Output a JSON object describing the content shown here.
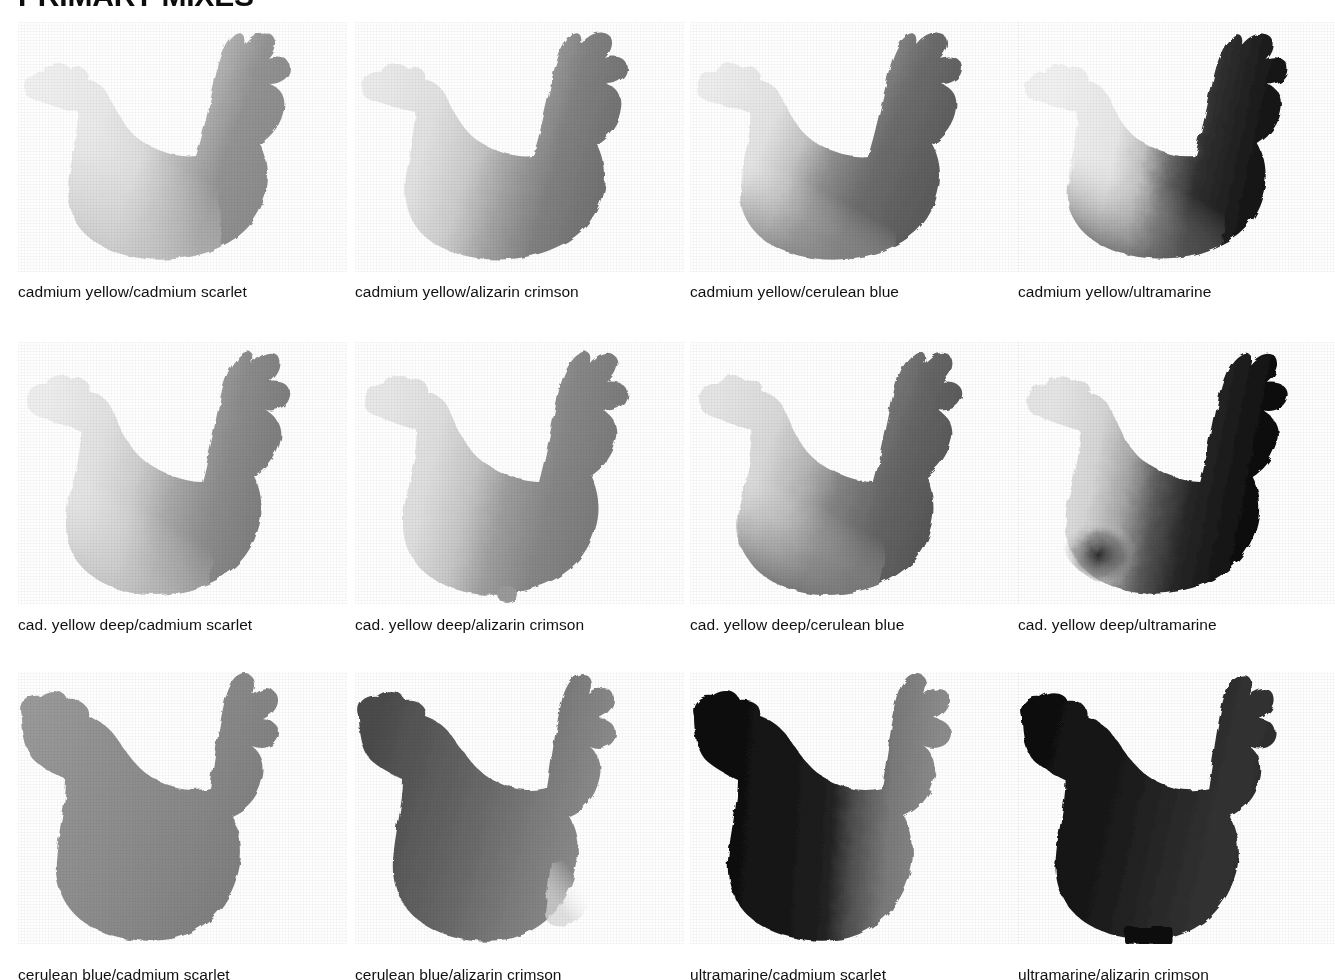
{
  "page": {
    "title": "PRIMARY MIXES",
    "background_color": "#ffffff",
    "text_color": "#111111",
    "columns": 4,
    "rows": 3
  },
  "swatches": [
    {
      "id": "cadmium-yellow-cadmium-scarlet",
      "caption": "cadmium yellow/cadmium scarlet",
      "shape": "hen-silhouette",
      "tone": {
        "light": "#ececec",
        "mid": "#cfcfcf",
        "dark": "#8d8d8d",
        "deepest": "#7e7e7e"
      },
      "gradient_direction": "left-light-to-right-dark",
      "overall_value": "very light"
    },
    {
      "id": "cadmium-yellow-alizarin-crimson",
      "caption": "cadmium yellow/alizarin crimson",
      "shape": "hen-silhouette",
      "tone": {
        "light": "#e6e6e6",
        "mid": "#c2c2c2",
        "dark": "#7b7b7b",
        "deepest": "#6a6a6a"
      },
      "gradient_direction": "left-light-to-right-dark",
      "overall_value": "light"
    },
    {
      "id": "cadmium-yellow-cerulean-blue",
      "caption": "cadmium yellow/cerulean blue",
      "shape": "hen-silhouette",
      "tone": {
        "light": "#e8e8e8",
        "mid": "#bdbdbd",
        "dark": "#6f6f6f",
        "deepest": "#5c5c5c"
      },
      "gradient_direction": "left-light-to-right-dark",
      "overall_value": "light-medium"
    },
    {
      "id": "cadmium-yellow-ultramarine",
      "caption": "cadmium yellow/ultramarine",
      "shape": "hen-silhouette",
      "tone": {
        "light": "#eaeaea",
        "mid": "#b0b0b0",
        "dark": "#3a3a3a",
        "deepest": "#141414"
      },
      "gradient_direction": "left-light-to-right-very-dark",
      "overall_value": "high contrast"
    },
    {
      "id": "cad-yellow-deep-cadmium-scarlet",
      "caption": "cad. yellow deep/cadmium scarlet",
      "shape": "hen-silhouette",
      "tone": {
        "light": "#e4e4e4",
        "mid": "#c7c7c7",
        "dark": "#8a8a8a",
        "deepest": "#7a7a7a"
      },
      "gradient_direction": "left-light-to-right-dark",
      "overall_value": "light"
    },
    {
      "id": "cad-yellow-deep-alizarin-crimson",
      "caption": "cad. yellow deep/alizarin crimson",
      "shape": "hen-silhouette",
      "tone": {
        "light": "#dedede",
        "mid": "#bdbdbd",
        "dark": "#8a8a8a",
        "deepest": "#767676"
      },
      "gradient_direction": "left-light-to-right-dark",
      "overall_value": "light-medium"
    },
    {
      "id": "cad-yellow-deep-cerulean-blue",
      "caption": "cad. yellow deep/cerulean blue",
      "shape": "hen-silhouette",
      "tone": {
        "light": "#dcdcdc",
        "mid": "#b0b0b0",
        "dark": "#6b6b6b",
        "deepest": "#565656"
      },
      "gradient_direction": "left-light-to-right-dark",
      "overall_value": "medium"
    },
    {
      "id": "cad-yellow-deep-ultramarine",
      "caption": "cad. yellow deep/ultramarine",
      "shape": "hen-silhouette",
      "tone": {
        "light": "#dcdcdc",
        "mid": "#9a9a9a",
        "dark": "#2e2e2e",
        "deepest": "#0d0d0d"
      },
      "gradient_direction": "left-light-to-right-very-dark",
      "overall_value": "high contrast"
    },
    {
      "id": "cerulean-blue-cadmium-scarlet",
      "caption": "cerulean blue/cadmium scarlet",
      "shape": "hen-silhouette",
      "tone": {
        "light": "#9b9b9b",
        "mid": "#8e8e8e",
        "dark": "#828282",
        "deepest": "#787878"
      },
      "gradient_direction": "even-flat",
      "overall_value": "uniform medium gray"
    },
    {
      "id": "cerulean-blue-alizarin-crimson",
      "caption": "cerulean blue/alizarin crimson",
      "shape": "hen-silhouette",
      "tone": {
        "light": "#8f8f8f",
        "mid": "#6f6f6f",
        "dark": "#4b4b4b",
        "deepest": "#3a3a3a"
      },
      "gradient_direction": "left-dark-to-right-mid",
      "overall_value": "medium dark"
    },
    {
      "id": "ultramarine-cadmium-scarlet",
      "caption": "ultramarine/cadmium scarlet",
      "shape": "hen-silhouette",
      "tone": {
        "light": "#8a8a8a",
        "mid": "#4a4a4a",
        "dark": "#1d1d1d",
        "deepest": "#0a0a0a"
      },
      "gradient_direction": "left-very-dark-to-right-light",
      "overall_value": "very dark"
    },
    {
      "id": "ultramarine-alizarin-crimson",
      "caption": "ultramarine/alizarin crimson",
      "shape": "hen-silhouette",
      "tone": {
        "light": "#4a4a4a",
        "mid": "#2a2a2a",
        "dark": "#161616",
        "deepest": "#070707"
      },
      "gradient_direction": "even-very-dark",
      "overall_value": "near black"
    }
  ],
  "layout": {
    "column_x": [
      18,
      355,
      690,
      1018
    ],
    "row_top": [
      18,
      330,
      660
    ],
    "caption_y": [
      278,
      598,
      940
    ],
    "swatch_width": 320,
    "swatch_height": 250
  }
}
